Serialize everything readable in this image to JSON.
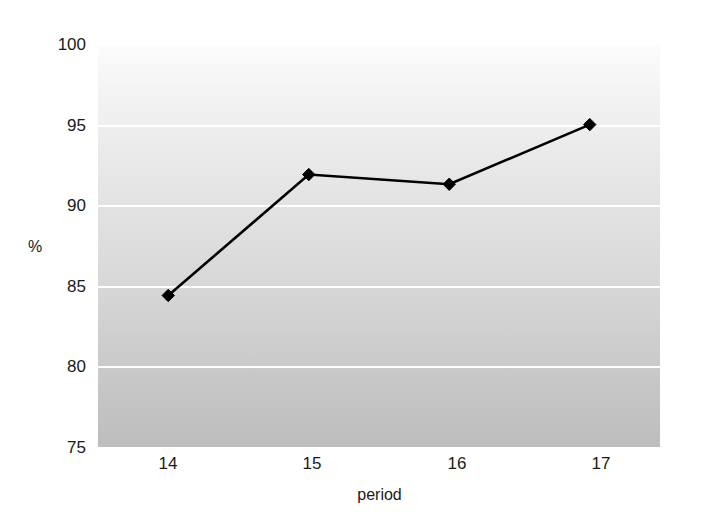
{
  "chart_data": {
    "type": "line",
    "title": "",
    "subtitle": "",
    "xlabel": "period",
    "ylabel": "%",
    "x": [
      14,
      15,
      16,
      17
    ],
    "categories": [
      "14",
      "15",
      "16",
      "17"
    ],
    "series": [
      {
        "name": "",
        "values": [
          84.4,
          91.9,
          91.3,
          95.0
        ]
      }
    ],
    "values": [
      84.4,
      91.9,
      91.3,
      95.0
    ],
    "xlim": [
      13.5,
      17.5
    ],
    "ylim": [
      75,
      100
    ],
    "y_ticks": [
      100,
      95,
      90,
      85,
      80,
      75
    ],
    "y_tick_labels": [
      "100",
      "95",
      "90",
      "85",
      "80",
      "75"
    ],
    "x_ticks": [
      14,
      15,
      16,
      17
    ],
    "x_tick_labels": [
      "14",
      "15",
      "16",
      "17"
    ],
    "grid": "horizontal",
    "gridline_color": "#ffffff",
    "legend": "none",
    "marker": "diamond",
    "marker_color": "#000000",
    "line_color": "#000000",
    "plot_background": "vertical-gradient-white-to-gray",
    "plot_bg_top_color": "#fcfcfc",
    "plot_bg_bottom_color": "#bdbdbd",
    "page_background": "#ffffff",
    "annotations": []
  }
}
